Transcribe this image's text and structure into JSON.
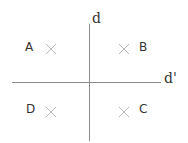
{
  "diagram": {
    "axes": {
      "vertical_label": "d",
      "horizontal_label": "d'"
    },
    "quadrants": [
      {
        "id": "A",
        "label": "A",
        "position": "top-left"
      },
      {
        "id": "B",
        "label": "B",
        "position": "top-right"
      },
      {
        "id": "C",
        "label": "C",
        "position": "bottom-right"
      },
      {
        "id": "D",
        "label": "D",
        "position": "bottom-left"
      }
    ],
    "colors": {
      "axis": "#8a8a8a",
      "text": "#333333",
      "cross": "#b8b8b8"
    }
  }
}
